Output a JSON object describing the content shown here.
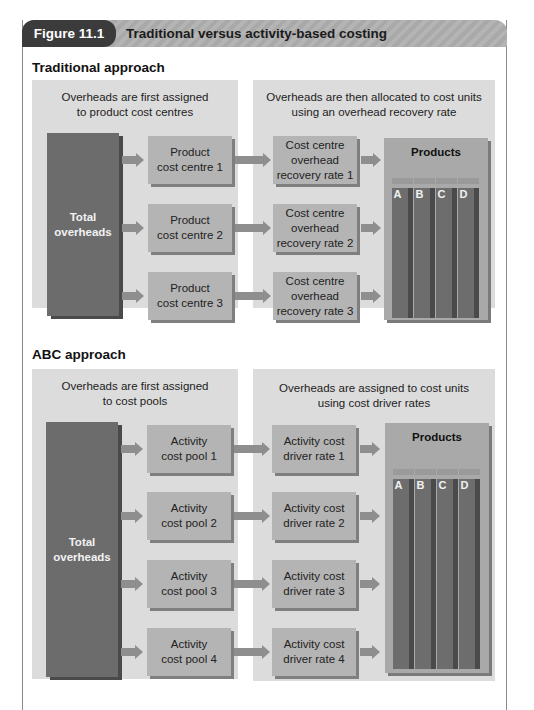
{
  "figure": {
    "number": "Figure 11.1",
    "title": "Traditional versus activity-based costing"
  },
  "traditional": {
    "heading": "Traditional approach",
    "left_caption": [
      "Overheads are first assigned",
      "to product cost centres"
    ],
    "right_caption": [
      "Overheads are then allocated to cost units",
      "using an overhead recovery rate"
    ],
    "source": [
      "Total",
      "overheads"
    ],
    "stage1": [
      [
        "Product",
        "cost centre 1"
      ],
      [
        "Product",
        "cost centre 2"
      ],
      [
        "Product",
        "cost centre 3"
      ]
    ],
    "stage2": [
      [
        "Cost centre",
        "overhead",
        "recovery rate 1"
      ],
      [
        "Cost centre",
        "overhead",
        "recovery rate 2"
      ],
      [
        "Cost centre",
        "overhead",
        "recovery rate 3"
      ]
    ],
    "products_label": "Products",
    "products": [
      "A",
      "B",
      "C",
      "D"
    ]
  },
  "abc": {
    "heading": "ABC approach",
    "left_caption": [
      "Overheads are first assigned",
      "to cost pools"
    ],
    "right_caption": [
      "Overheads are assigned to cost units",
      "using cost driver rates"
    ],
    "source": [
      "Total",
      "overheads"
    ],
    "stage1": [
      [
        "Activity",
        "cost pool 1"
      ],
      [
        "Activity",
        "cost pool 2"
      ],
      [
        "Activity",
        "cost pool 3"
      ],
      [
        "Activity",
        "cost pool 4"
      ]
    ],
    "stage2": [
      [
        "Activity cost",
        "driver rate 1"
      ],
      [
        "Activity cost",
        "driver rate 2"
      ],
      [
        "Activity cost",
        "driver rate 3"
      ],
      [
        "Activity cost",
        "driver rate 4"
      ]
    ],
    "products_label": "Products",
    "products": [
      "A",
      "B",
      "C",
      "D"
    ]
  },
  "colors": {
    "header_tag": "#3b3b3b",
    "header_bar": "#adadad",
    "panel": "#dcdcdc",
    "box": "#b4b4b4",
    "total": "#6c6c6c",
    "product_bar": "#6d6d6d",
    "arrow": "#8e8e8e"
  }
}
